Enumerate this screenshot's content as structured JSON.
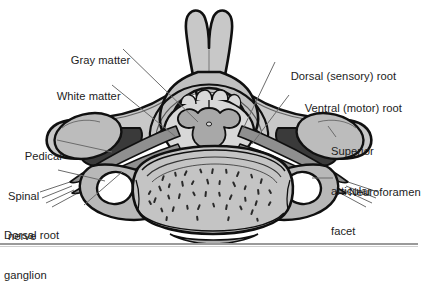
{
  "figure": {
    "name": "cervical-vertebra-cross-section",
    "background_color": "#ffffff",
    "divider_color": "#9a9a9a"
  },
  "labels": [
    {
      "id": "gray-matter",
      "text": "Gray matter",
      "x": 58,
      "y": 41,
      "lines": [
        "Gray matter"
      ]
    },
    {
      "id": "white-matter",
      "text": "White matter",
      "x": 44,
      "y": 77,
      "lines": [
        "White matter"
      ]
    },
    {
      "id": "pedical",
      "text": "Pedical",
      "x": 12,
      "y": 137,
      "lines": [
        "Pedical"
      ]
    },
    {
      "id": "spinal-nerve",
      "text": "Spinal nerve",
      "x": 8,
      "y": 170,
      "lines": [
        "Spinal",
        "nerve"
      ]
    },
    {
      "id": "dorsal-root-ganglion",
      "text": "Dorsal root ganglion",
      "x": 4,
      "y": 209,
      "lines": [
        "Dorsal root",
        "ganglion"
      ]
    },
    {
      "id": "dorsal-sensory-root",
      "text": "Dorsal (sensory) root",
      "x": 278,
      "y": 57,
      "lines": [
        "Dorsal (sensory) root"
      ]
    },
    {
      "id": "ventral-motor-root",
      "text": "Ventral (motor) root",
      "x": 292,
      "y": 89,
      "lines": [
        "Ventral (motor) root"
      ]
    },
    {
      "id": "superior-articular-facet",
      "text": "Superior articular facet",
      "x": 331,
      "y": 118,
      "lines": [
        "Superior",
        "articular",
        "facet"
      ]
    },
    {
      "id": "neuroforamen",
      "text": "Neuroforamen",
      "x": 336,
      "y": 173,
      "lines": [
        "Neuroforamen"
      ]
    }
  ],
  "label_text": {
    "gray_matter": "Gray matter",
    "white_matter": "White matter",
    "pedical": "Pedical",
    "spinal_nerve_l1": "Spinal",
    "spinal_nerve_l2": "nerve",
    "dorsal_root_ganglion_l1": "Dorsal root",
    "dorsal_root_ganglion_l2": "ganglion",
    "dorsal_sensory_root": "Dorsal (sensory) root",
    "ventral_motor_root": "Ventral (motor) root",
    "superior_articular_facet_l1": "Superior",
    "superior_articular_facet_l2": "articular",
    "superior_articular_facet_l3": "facet",
    "neuroforamen": "Neuroforamen"
  },
  "anatomy_colors": {
    "outline": "#101010",
    "bone_light": "#c8c8c8",
    "bone_mid": "#b0b0b0",
    "bone_shade": "#8f8f8f",
    "facet_light": "#bcbcbc",
    "pedicle_dark": "#3a3a3a",
    "root_dark": "#4a4a4a",
    "gray_matter": "#a8a8a8",
    "white_matter": "#d8d8d8",
    "foramen_white": "#ffffff",
    "leader_line": "#6b6b6b",
    "trabeculae": "#2a2a2a"
  }
}
